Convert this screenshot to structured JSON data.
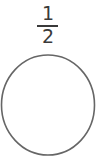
{
  "fraction": {
    "numerator": "1",
    "denominator": "2"
  },
  "shape": {
    "type": "circle",
    "stroke_color": "#666666",
    "fill_color": "#ffffff"
  }
}
